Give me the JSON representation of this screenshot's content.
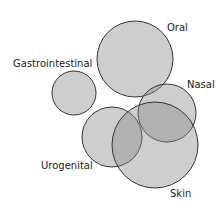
{
  "diagram": {
    "type": "euler",
    "fill_color": "#8a8a8a",
    "stroke_color": "#333333",
    "sets": [
      {
        "name": "Oral",
        "cx": 135,
        "cy": 59,
        "r": 38,
        "label_x": 167,
        "label_y": 31
      },
      {
        "name": "Gastrointestinal",
        "cx": 74,
        "cy": 93,
        "r": 22,
        "label_x": 13,
        "label_y": 67
      },
      {
        "name": "Nasal",
        "cx": 167,
        "cy": 113,
        "r": 29,
        "label_x": 187,
        "label_y": 88
      },
      {
        "name": "Urogenital",
        "cx": 112,
        "cy": 137,
        "r": 30,
        "label_x": 41,
        "label_y": 169
      },
      {
        "name": "Skin",
        "cx": 155,
        "cy": 145,
        "r": 43,
        "label_x": 170,
        "label_y": 197
      }
    ]
  }
}
